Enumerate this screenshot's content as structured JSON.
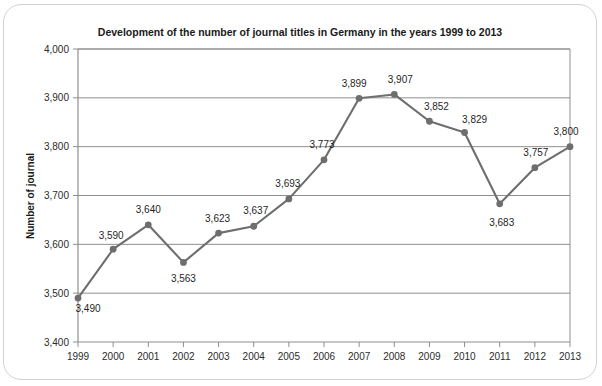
{
  "chart_data": {
    "type": "line",
    "title": "Development of the number of journal titles in Germany in the years 1999 to 2013",
    "xlabel": "",
    "ylabel": "Number of journal",
    "categories": [
      "1999",
      "2000",
      "2001",
      "2002",
      "2003",
      "2004",
      "2005",
      "2006",
      "2007",
      "2008",
      "2009",
      "2010",
      "2011",
      "2012",
      "2013"
    ],
    "values": [
      3490,
      3590,
      3640,
      3563,
      3623,
      3637,
      3693,
      3773,
      3899,
      3907,
      3852,
      3829,
      3683,
      3757,
      3800
    ],
    "point_labels": [
      "3,490",
      "3,590",
      "3,640",
      "3,563",
      "3,623",
      "3,637",
      "3,693",
      "3,773",
      "3,899",
      "3,907",
      "3,852",
      "3,829",
      "3,683",
      "3,757",
      "3,800"
    ],
    "ylim": [
      3400,
      4000
    ],
    "ytick_values": [
      3400,
      3500,
      3600,
      3700,
      3800,
      3900,
      4000
    ],
    "ytick_labels": [
      "3,400",
      "3,500",
      "3,600",
      "3,700",
      "3,800",
      "3,900",
      "4,000"
    ],
    "grid": true,
    "legend": false,
    "legend_position": "none",
    "series": [
      {
        "name": "Number of journal titles",
        "values": [
          3490,
          3590,
          3640,
          3563,
          3623,
          3637,
          3693,
          3773,
          3899,
          3907,
          3852,
          3829,
          3683,
          3757,
          3800
        ]
      }
    ],
    "colors": {
      "line": "#6e6e6e",
      "marker": "#6e6e6e",
      "grid": "#8f8f8f",
      "axis": "#8f8f8f",
      "text": "#1a1a1a",
      "background": "#ffffff",
      "card_border": "#d2d2d2"
    },
    "label_offsets": [
      {
        "dx": 10,
        "dy": 14
      },
      {
        "dx": -2,
        "dy": -10
      },
      {
        "dx": 0,
        "dy": -12
      },
      {
        "dx": 0,
        "dy": 20
      },
      {
        "dx": -1,
        "dy": -11
      },
      {
        "dx": 2,
        "dy": -12
      },
      {
        "dx": -1,
        "dy": -12
      },
      {
        "dx": -2,
        "dy": -12
      },
      {
        "dx": -5,
        "dy": -11
      },
      {
        "dx": 6,
        "dy": -11
      },
      {
        "dx": 7,
        "dy": -11
      },
      {
        "dx": 10,
        "dy": -10
      },
      {
        "dx": 2,
        "dy": 22
      },
      {
        "dx": 1,
        "dy": -12
      },
      {
        "dx": -4,
        "dy": -12
      }
    ]
  },
  "geometry": {
    "plot_left": 78,
    "plot_right": 570,
    "plot_top": 49,
    "plot_bottom": 342,
    "title_x": 300,
    "title_y": 36,
    "ylabel_x": 34,
    "ylabel_y": 196
  }
}
